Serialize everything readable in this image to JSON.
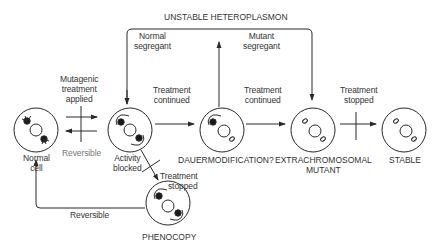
{
  "title": "UNSTABLE HETEROPLASMON",
  "nodes": {
    "normal": {
      "label_line1": "Normal",
      "label_line2": "cell"
    },
    "blocked": {
      "label_line1": "Activity",
      "label_line2": "blocked"
    },
    "dauer": {
      "label": "DAUERMODIFICATION?"
    },
    "extra": {
      "label_line1": "EXTRACHROMOSOMAL",
      "label_line2": "MUTANT"
    },
    "stable": {
      "label": "STABLE"
    },
    "phenocopy": {
      "label": "PHENOCOPY"
    }
  },
  "edges": {
    "mutagenic": {
      "line1": "Mutagenic",
      "line2": "treatment",
      "line3": "applied"
    },
    "reversible_top": {
      "label": "Reversible"
    },
    "treatment_continued_1": {
      "line1": "Treatment",
      "line2": "continued"
    },
    "treatment_continued_2": {
      "line1": "Treatment",
      "line2": "continued"
    },
    "treatment_stopped_stable": {
      "line1": "Treatment",
      "line2": "stopped"
    },
    "treatment_stopped_pheno": {
      "line1": "Treatment",
      "line2": "stopped"
    },
    "normal_segregant": {
      "line1": "Normal",
      "line2": "segregant"
    },
    "mutant_segregant": {
      "line1": "Mutant",
      "line2": "segregant"
    },
    "reversible_bottom": {
      "label": "Reversible"
    }
  },
  "colors": {
    "stroke": "#2a2a2a",
    "background": "#ffffff"
  }
}
